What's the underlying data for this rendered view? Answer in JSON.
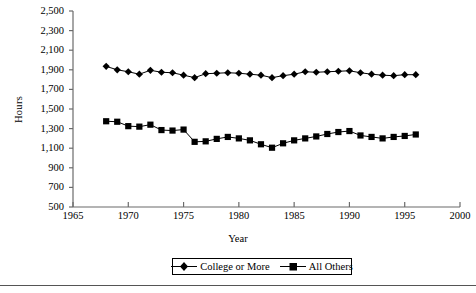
{
  "chart_data": {
    "type": "line",
    "title": "",
    "xlabel": "Year",
    "ylabel": "Hours",
    "xlim": [
      1965,
      2000
    ],
    "ylim": [
      500,
      2500
    ],
    "xticks": [
      1965,
      1970,
      1975,
      1980,
      1985,
      1990,
      1995,
      2000
    ],
    "yticks": [
      500,
      700,
      900,
      1100,
      1300,
      1500,
      1700,
      1900,
      2100,
      2300,
      2500
    ],
    "ytick_labels": [
      "500",
      "700",
      "900",
      "1,100",
      "1,300",
      "1,500",
      "1,700",
      "1,900",
      "2,100",
      "2,300",
      "2,500"
    ],
    "xtick_labels": [
      "1965",
      "1970",
      "1975",
      "1980",
      "1985",
      "1990",
      "1995",
      "2000"
    ],
    "grid": false,
    "legend_position": "bottom-center",
    "x": [
      1968,
      1969,
      1970,
      1971,
      1972,
      1973,
      1974,
      1975,
      1976,
      1977,
      1978,
      1979,
      1980,
      1981,
      1982,
      1983,
      1984,
      1985,
      1986,
      1987,
      1988,
      1989,
      1990,
      1991,
      1992,
      1993,
      1994,
      1995,
      1996
    ],
    "series": [
      {
        "name": "College or More",
        "marker": "diamond",
        "color": "#000000",
        "values": [
          1935,
          1900,
          1880,
          1855,
          1895,
          1875,
          1870,
          1845,
          1820,
          1860,
          1865,
          1870,
          1865,
          1855,
          1845,
          1820,
          1840,
          1855,
          1880,
          1875,
          1880,
          1885,
          1890,
          1870,
          1855,
          1845,
          1840,
          1850,
          1850
        ]
      },
      {
        "name": "All Others",
        "marker": "square",
        "color": "#000000",
        "values": [
          1375,
          1370,
          1325,
          1320,
          1340,
          1285,
          1280,
          1290,
          1165,
          1170,
          1195,
          1215,
          1200,
          1180,
          1140,
          1105,
          1150,
          1180,
          1200,
          1220,
          1245,
          1265,
          1275,
          1230,
          1215,
          1200,
          1215,
          1225,
          1240
        ]
      }
    ]
  },
  "axis": {
    "ylabel": "Hours",
    "xlabel": "Year"
  },
  "legend": {
    "items": [
      {
        "label": "College or More",
        "marker": "diamond"
      },
      {
        "label": "All Others",
        "marker": "square"
      }
    ]
  }
}
